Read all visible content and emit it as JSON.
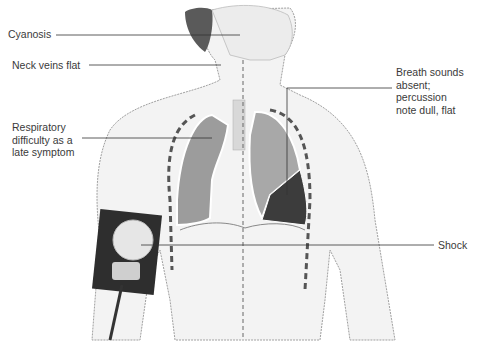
{
  "diagram": {
    "labels": [
      {
        "id": "cyanosis",
        "text": "Cyanosis"
      },
      {
        "id": "neck-veins",
        "text": "Neck veins flat"
      },
      {
        "id": "respiratory",
        "text": "Respiratory\ndifficulty as a\nlate symptom"
      },
      {
        "id": "breath-sounds",
        "text": "Breath sounds\nabsent;\npercussion\nnote dull, flat"
      },
      {
        "id": "shock",
        "text": "Shock"
      }
    ],
    "colors": {
      "skin": "#f2f2f2",
      "outline": "#9a9a9a",
      "lung_right": "#9c9c9c",
      "lung_left_upper": "#a8a8a8",
      "lung_left_fluid": "#3c3c3c",
      "hair": "#5a5a5a",
      "cuff": "#2e2e2e",
      "leader_line": "#333333"
    }
  }
}
